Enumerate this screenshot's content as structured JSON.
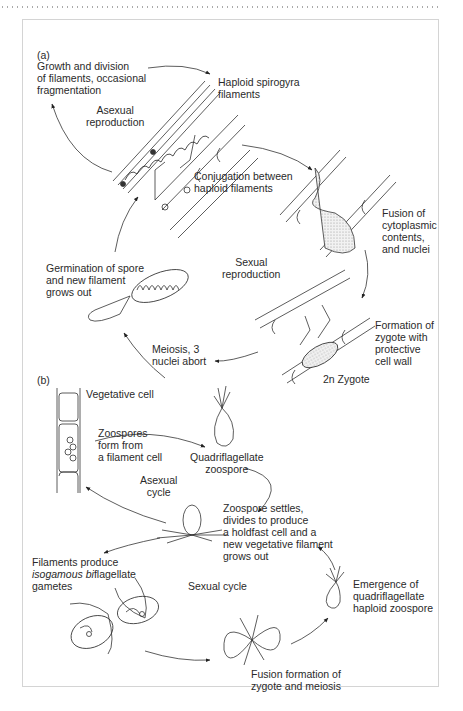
{
  "panel_a": {
    "label": "(a)",
    "growth": "Growth and division\nof filaments, occasional\nfragmentation",
    "haploid": "Haploid spirogyra\nfilaments",
    "asexual": "Asexual\nreproduction",
    "conjugation": "Conjugation between\nhaploid filaments",
    "fusion": "Fusion of\ncytoplasmic\ncontents,\nand nuclei",
    "sexual": "Sexual\nreproduction",
    "germination": "Germination of spore\nand new filament\ngrows out",
    "formation": "Formation of\nzygote with\nprotective\ncell wall",
    "meiosis": "Meiosis, 3\nnuclei abort",
    "zygote": "2n Zygote"
  },
  "panel_b": {
    "label": "(b)",
    "vegetative": "Vegetative cell",
    "zoospores": "Zoospores\nform from\na filament cell",
    "quadri": "Quadriflagellate\nzoospore",
    "asexual": "Asexual\ncycle",
    "settles": "Zoospore settles,\ndivides to produce\na holdfast cell and a\nnew vegetative filament\ngrows out",
    "filaments_1": "Filaments produce",
    "filaments_2a": "isogamous ",
    "filaments_2b": "bi",
    "filaments_2c": "flagellate",
    "filaments_3": "gametes",
    "sexual": "Sexual cycle",
    "emergence": "Emergence of\nquadriflagellate\nhaploid zoospore",
    "fusion": "Fusion formation of\nzygote and meiosis"
  }
}
